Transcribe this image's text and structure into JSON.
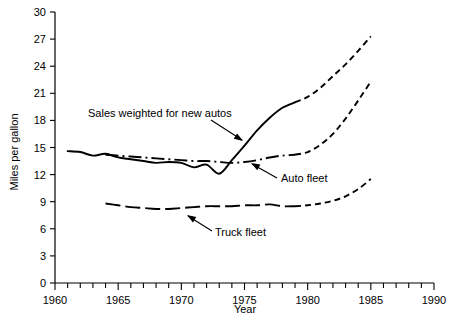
{
  "chart_data": {
    "type": "line",
    "title": "",
    "xlabel": "Year",
    "ylabel": "Miles per gallon",
    "xlim": [
      1960,
      1990
    ],
    "ylim": [
      0,
      30
    ],
    "xticks": [
      1960,
      1965,
      1970,
      1975,
      1980,
      1985,
      1990
    ],
    "xtick_labels": [
      "1960",
      "1965",
      "1970",
      "1975",
      "1980",
      "1985",
      "1990"
    ],
    "xtick_minor_step": 1,
    "yticks": [
      0,
      3,
      6,
      9,
      12,
      15,
      18,
      21,
      24,
      27,
      30
    ],
    "ytick_labels": [
      "0",
      "3",
      "6",
      "9",
      "12",
      "15",
      "18",
      "21",
      "24",
      "27",
      "30"
    ],
    "grid": false,
    "legend": "inline-annotations",
    "series": [
      {
        "name": "Sales weighted for new autos",
        "label": "Sales weighted for new autos",
        "style_historic": "solid",
        "style_projected": "dashed",
        "projection_starts": 1979,
        "x": [
          1961,
          1962,
          1963,
          1964,
          1965,
          1966,
          1967,
          1968,
          1969,
          1970,
          1971,
          1972,
          1973,
          1974,
          1975,
          1976,
          1977,
          1978,
          1979,
          1980,
          1981,
          1982,
          1983,
          1984,
          1985
        ],
        "y": [
          14.6,
          14.5,
          14.1,
          14.3,
          13.9,
          13.7,
          13.5,
          13.3,
          13.4,
          13.3,
          12.8,
          13.1,
          12.1,
          13.6,
          15.2,
          16.9,
          18.3,
          19.4,
          20.0,
          20.6,
          21.6,
          22.9,
          24.2,
          25.7,
          27.3
        ]
      },
      {
        "name": "Auto fleet",
        "label": "Auto fleet",
        "style_historic": "dash-dot",
        "style_projected": "dashed",
        "projection_starts": 1979,
        "x": [
          1964,
          1965,
          1966,
          1967,
          1968,
          1969,
          1970,
          1971,
          1972,
          1973,
          1974,
          1975,
          1976,
          1977,
          1978,
          1979,
          1980,
          1981,
          1982,
          1983,
          1984,
          1985
        ],
        "y": [
          14.2,
          14.1,
          14.0,
          13.9,
          13.8,
          13.7,
          13.6,
          13.5,
          13.5,
          13.4,
          13.3,
          13.4,
          13.6,
          13.9,
          14.1,
          14.2,
          14.5,
          15.3,
          16.5,
          18.2,
          20.2,
          22.3
        ]
      },
      {
        "name": "Truck fleet",
        "label": "Truck fleet",
        "style_historic": "dash-long",
        "style_projected": "dashed",
        "projection_starts": 1979,
        "x": [
          1964,
          1965,
          1966,
          1967,
          1968,
          1969,
          1970,
          1971,
          1972,
          1973,
          1974,
          1975,
          1976,
          1977,
          1978,
          1979,
          1980,
          1981,
          1982,
          1983,
          1984,
          1985
        ],
        "y": [
          8.8,
          8.6,
          8.4,
          8.3,
          8.2,
          8.2,
          8.3,
          8.4,
          8.5,
          8.5,
          8.5,
          8.6,
          8.6,
          8.7,
          8.5,
          8.5,
          8.6,
          8.8,
          9.1,
          9.6,
          10.4,
          11.5
        ]
      }
    ],
    "annotations": [
      {
        "text": "Sales weighted for new autos",
        "name": "annotation-sales-weighted",
        "text_x": 88,
        "text_y": 117,
        "leader": "M 211 120 L 242 140",
        "arrow_at": [
          243,
          141
        ]
      },
      {
        "text": "Auto fleet",
        "name": "annotation-auto-fleet",
        "text_x": 281,
        "text_y": 182,
        "leader": "M 277 178 L 252 164",
        "arrow_at": [
          251,
          163
        ]
      },
      {
        "text": "Truck fleet",
        "name": "annotation-truck-fleet",
        "text_x": 215,
        "text_y": 236,
        "leader": "M 212 231 L 188 216",
        "arrow_at": [
          187,
          215
        ]
      }
    ],
    "colors": {
      "line": "#000000",
      "axis": "#000000",
      "background": "#ffffff"
    }
  }
}
